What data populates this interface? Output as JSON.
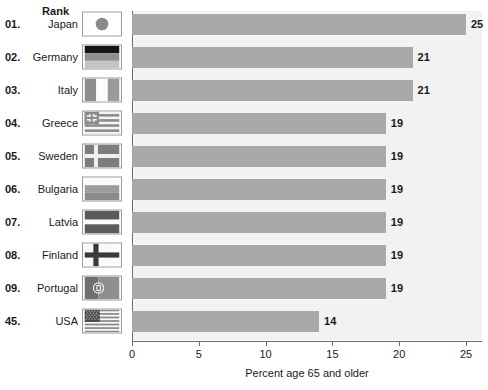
{
  "header": {
    "rank_label": "Rank"
  },
  "chart_data": {
    "type": "bar",
    "orientation": "horizontal",
    "title": "",
    "xlabel": "Percent age 65 and older",
    "ylabel": "",
    "xlim": [
      0,
      25
    ],
    "xticks": [
      0,
      5,
      10,
      15,
      20,
      25
    ],
    "xtick_labels": [
      "0",
      "5",
      "10",
      "15",
      "20",
      "25"
    ],
    "grid": false,
    "legend": "none",
    "bar_color": "#a9a9a9",
    "plot_background": "#f2f2f2",
    "axis_color": "#6d6d6d",
    "categories": [
      "Japan",
      "Germany",
      "Italy",
      "Greece",
      "Sweden",
      "Bulgaria",
      "Latvia",
      "Finland",
      "Portugal",
      "USA"
    ],
    "values": [
      25,
      21,
      21,
      19,
      19,
      19,
      19,
      19,
      19,
      14
    ],
    "ranks": [
      "01.",
      "02.",
      "03.",
      "04.",
      "05.",
      "06.",
      "07.",
      "08.",
      "09.",
      "45."
    ],
    "data_labels": [
      "25",
      "21",
      "21",
      "19",
      "19",
      "19",
      "19",
      "19",
      "19",
      "14"
    ],
    "rows": [
      {
        "rank": "01.",
        "country": "Japan",
        "value": 25,
        "label": "25",
        "flag": "flag-japan"
      },
      {
        "rank": "02.",
        "country": "Germany",
        "value": 21,
        "label": "21",
        "flag": "flag-germany"
      },
      {
        "rank": "03.",
        "country": "Italy",
        "value": 21,
        "label": "21",
        "flag": "flag-italy"
      },
      {
        "rank": "04.",
        "country": "Greece",
        "value": 19,
        "label": "19",
        "flag": "flag-greece"
      },
      {
        "rank": "05.",
        "country": "Sweden",
        "value": 19,
        "label": "19",
        "flag": "flag-sweden"
      },
      {
        "rank": "06.",
        "country": "Bulgaria",
        "value": 19,
        "label": "19",
        "flag": "flag-bulgaria"
      },
      {
        "rank": "07.",
        "country": "Latvia",
        "value": 19,
        "label": "19",
        "flag": "flag-latvia"
      },
      {
        "rank": "08.",
        "country": "Finland",
        "value": 19,
        "label": "19",
        "flag": "flag-finland"
      },
      {
        "rank": "09.",
        "country": "Portugal",
        "value": 19,
        "label": "19",
        "flag": "flag-portugal"
      },
      {
        "rank": "45.",
        "country": "USA",
        "value": 14,
        "label": "14",
        "flag": "flag-usa"
      }
    ]
  }
}
